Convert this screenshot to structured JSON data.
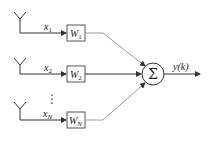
{
  "diagram": {
    "inputs": [
      {
        "signal": "x",
        "sub": "1",
        "weight": "W",
        "wsub": "1"
      },
      {
        "signal": "x",
        "sub": "2",
        "weight": "W",
        "wsub": "2"
      },
      {
        "signal": "x",
        "sub": "N",
        "weight": "W",
        "wsub": "N"
      }
    ],
    "ellipsis": "⋮",
    "sum_symbol": "Σ",
    "output_label": "y(k)",
    "colors": {
      "line": "#333333",
      "weight_line": "#9a9a9a",
      "box": "#555555"
    }
  }
}
